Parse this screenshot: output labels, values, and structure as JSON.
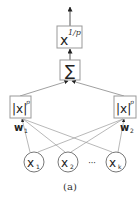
{
  "diagram": {
    "caption": "(a)",
    "root_node": {
      "base": "x",
      "exponent": "1/p"
    },
    "sum_node": {
      "symbol": "∑"
    },
    "power_nodes": [
      {
        "id": "left",
        "label": "|x|",
        "exponent": "p",
        "weight_label": "w",
        "weight_sub": "1"
      },
      {
        "id": "right",
        "label": "|x|",
        "exponent": "p",
        "weight_label": "w",
        "weight_sub": "2"
      }
    ],
    "inputs": [
      {
        "label": "x",
        "sub": "1"
      },
      {
        "label": "x",
        "sub": "2"
      },
      {
        "label": "x",
        "sub": "k"
      }
    ],
    "ellipsis": "···",
    "colors": {
      "line": "#888888",
      "box_border": "#888888",
      "text": "#222222",
      "arrow": "#222222"
    }
  }
}
